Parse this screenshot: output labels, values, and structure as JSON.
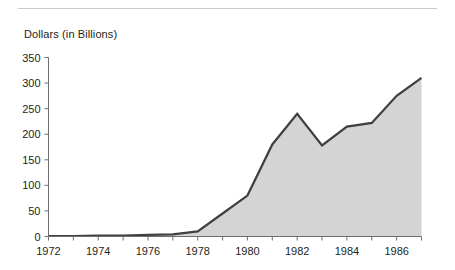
{
  "figure": {
    "y_axis_title": "Dollars (in Billions)"
  },
  "chart_data": {
    "type": "area",
    "title": "",
    "subtitle": "",
    "xlabel": "",
    "ylabel": "Dollars (in Billions)",
    "x": [
      1972,
      1973,
      1974,
      1975,
      1976,
      1977,
      1978,
      1979,
      1980,
      1981,
      1982,
      1983,
      1984,
      1985,
      1986,
      1987
    ],
    "values": [
      1,
      1,
      2,
      2,
      3,
      4,
      10,
      45,
      80,
      180,
      240,
      178,
      215,
      222,
      275,
      310
    ],
    "series": [
      {
        "name": "Dollars (in Billions)",
        "values": [
          1,
          1,
          2,
          2,
          3,
          4,
          10,
          45,
          80,
          180,
          240,
          178,
          215,
          222,
          275,
          310
        ]
      }
    ],
    "xlim": [
      1972,
      1987
    ],
    "ylim": [
      0,
      350
    ],
    "ytick_labels": [
      "0",
      "50",
      "100",
      "150",
      "200",
      "250",
      "300",
      "350"
    ],
    "ytick_values": [
      0,
      50,
      100,
      150,
      200,
      250,
      300,
      350
    ],
    "xtick_labels": [
      "1972",
      "1974",
      "1976",
      "1978",
      "1980",
      "1982",
      "1984",
      "1986"
    ],
    "xtick_values": [
      1972,
      1974,
      1976,
      1978,
      1980,
      1982,
      1984,
      1986
    ],
    "xminor_tick_values": [
      1973,
      1975,
      1977,
      1979,
      1981,
      1983,
      1985,
      1987
    ],
    "grid": false,
    "legend": false,
    "legend_position": "none",
    "area_fill_color": "#d4d4d4",
    "line_color": "#3f3f3f",
    "axis_color": "#6e6e6e",
    "annotations": []
  }
}
